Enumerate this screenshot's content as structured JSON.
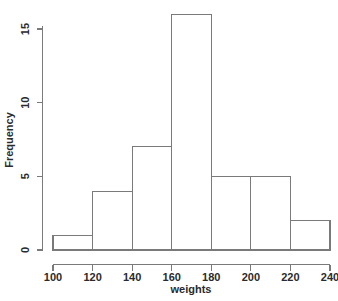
{
  "chart_data": {
    "type": "bar",
    "chart_subtype": "histogram",
    "title": "",
    "xlabel": "weights",
    "ylabel": "Frequency",
    "bin_width": 20,
    "bin_edges": [
      100,
      120,
      140,
      160,
      180,
      200,
      220,
      240
    ],
    "categories": [
      "100-120",
      "120-140",
      "140-160",
      "160-180",
      "180-200",
      "200-220",
      "220-240"
    ],
    "values": [
      1,
      4,
      7,
      16,
      5,
      5,
      2
    ],
    "bars": [
      {
        "x0": 100,
        "x1": 120,
        "frequency": 1
      },
      {
        "x0": 120,
        "x1": 140,
        "frequency": 4
      },
      {
        "x0": 140,
        "x1": 160,
        "frequency": 7
      },
      {
        "x0": 160,
        "x1": 180,
        "frequency": 16
      },
      {
        "x0": 180,
        "x1": 200,
        "frequency": 5
      },
      {
        "x0": 200,
        "x1": 220,
        "frequency": 5
      },
      {
        "x0": 220,
        "x1": 240,
        "frequency": 2
      }
    ],
    "xlim": [
      100,
      240
    ],
    "ylim": [
      0,
      16
    ],
    "x_ticks": [
      100,
      120,
      140,
      160,
      180,
      200,
      220,
      240
    ],
    "x_tick_labels": [
      "100",
      "120",
      "140",
      "160",
      "180",
      "200",
      "220",
      "240"
    ],
    "y_ticks": [
      0,
      5,
      10,
      15
    ],
    "y_tick_labels": [
      "0",
      "5",
      "10",
      "15"
    ],
    "grid": false,
    "legend": null,
    "legend_position": "none",
    "bar_fill_color": "#ffffff",
    "bar_stroke_color": "#7a7a7a",
    "axis_color": "#7a7a7a",
    "text_color": "#2b2b2b",
    "background_color": "#ffffff",
    "total_count": 40
  }
}
